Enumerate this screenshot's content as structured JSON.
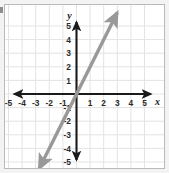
{
  "figure": {
    "title": "",
    "axis_label_x": "x",
    "axis_label_y": "y",
    "grid_color": "#e3e3e3",
    "axis_color": "#1a1a1a",
    "line_color": "#999999",
    "frame_color": "#b9b9b9",
    "background_color": "#ffffff",
    "page_background_color": "#f3f3f3"
  },
  "chart_data": {
    "type": "line",
    "title": "",
    "xlabel": "x",
    "ylabel": "y",
    "xlim": [
      -5.9,
      5.9
    ],
    "ylim": [
      -5.9,
      5.9
    ],
    "xticks": [
      -5,
      -4,
      -3,
      -2,
      -1,
      1,
      2,
      3,
      4,
      5
    ],
    "yticks": [
      5,
      4,
      3,
      2,
      1,
      -1,
      -2,
      -3,
      -4,
      -5
    ],
    "xtick_labels": [
      "-5",
      "-4",
      "-3",
      "-2",
      "-1",
      "1",
      "2",
      "3",
      "4",
      "5"
    ],
    "ytick_labels": [
      "5",
      "4",
      "3",
      "2",
      "1",
      "-1",
      "-2",
      "-3",
      "-4",
      "-5"
    ],
    "grid": true,
    "legend": "none",
    "series": [
      {
        "name": "line",
        "equation": "y = 2x",
        "slope": 2,
        "intercept": 0,
        "color": "#999999",
        "arrows": "both",
        "x": [
          -2.75,
          3.0
        ],
        "y": [
          -5.5,
          6.0
        ],
        "points": [
          {
            "x": -2.75,
            "y": -5.5
          },
          {
            "x": -1,
            "y": -2
          },
          {
            "x": 0,
            "y": 0
          },
          {
            "x": 1,
            "y": 2
          },
          {
            "x": 3.0,
            "y": 6.0
          }
        ]
      }
    ]
  },
  "ticks": {
    "x": [
      {
        "label": "-5",
        "value": -5
      },
      {
        "label": "-4",
        "value": -4
      },
      {
        "label": "-3",
        "value": -3
      },
      {
        "label": "-2",
        "value": -2
      },
      {
        "label": "-1",
        "value": -1
      },
      {
        "label": "1",
        "value": 1
      },
      {
        "label": "2",
        "value": 2
      },
      {
        "label": "3",
        "value": 3
      },
      {
        "label": "4",
        "value": 4
      },
      {
        "label": "5",
        "value": 5
      }
    ],
    "y": [
      {
        "label": "5",
        "value": 5
      },
      {
        "label": "4",
        "value": 4
      },
      {
        "label": "3",
        "value": 3
      },
      {
        "label": "2",
        "value": 2
      },
      {
        "label": "1",
        "value": 1
      },
      {
        "label": "-1",
        "value": -1
      },
      {
        "label": "-2",
        "value": -2
      },
      {
        "label": "-3",
        "value": -3
      },
      {
        "label": "-4",
        "value": -4
      },
      {
        "label": "-5",
        "value": -5
      }
    ]
  }
}
